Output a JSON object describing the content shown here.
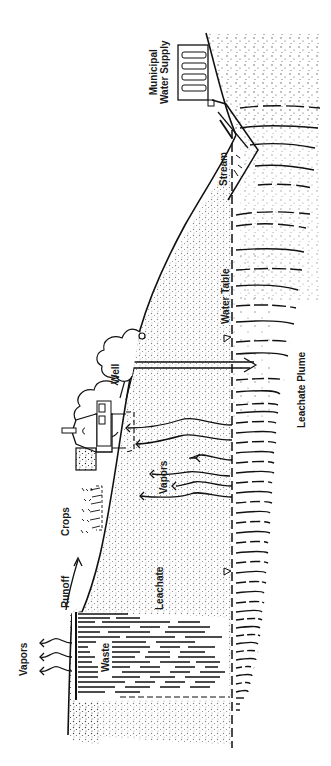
{
  "diagram": {
    "orientation": "rotated -90deg (reads bottom-to-top)",
    "labels": {
      "municipal_line1": "Municipal",
      "municipal_line2": "Water Supply",
      "stream": "Stream",
      "water_table": "Water Table",
      "well": "Well",
      "leachate_plume": "Leachate Plume",
      "vapors_subsurface": "Vapors",
      "crops": "Crops",
      "runoff": "Runoff",
      "leachate": "Leachate",
      "waste": "Waste",
      "vapors_surface": "Vapors"
    },
    "symbols": {
      "water_table_markers": [
        "triangle-marker",
        "triangle-marker"
      ]
    },
    "colors": {
      "ink": "#1a1a1a",
      "background": "#ffffff"
    }
  }
}
